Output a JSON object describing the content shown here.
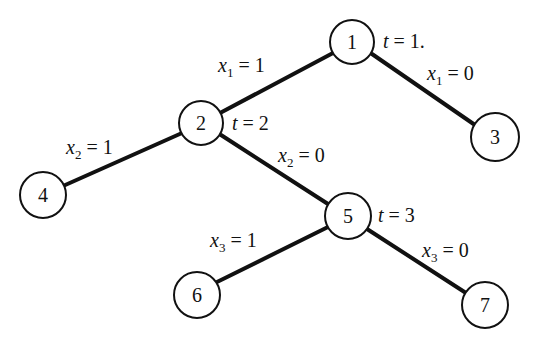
{
  "diagram": {
    "type": "branch-and-bound tree",
    "nodes": [
      {
        "id": "1",
        "label": "1",
        "cx": 352,
        "cy": 42
      },
      {
        "id": "2",
        "label": "2",
        "cx": 201,
        "cy": 123
      },
      {
        "id": "3",
        "label": "3",
        "cx": 495,
        "cy": 137
      },
      {
        "id": "4",
        "label": "4",
        "cx": 43,
        "cy": 195
      },
      {
        "id": "5",
        "label": "5",
        "cx": 348,
        "cy": 216
      },
      {
        "id": "6",
        "label": "6",
        "cx": 197,
        "cy": 295
      },
      {
        "id": "7",
        "label": "7",
        "cx": 485,
        "cy": 305
      }
    ],
    "edges": [
      {
        "from": "1",
        "to": "2",
        "var": "x",
        "sub": "1",
        "eq": " = ",
        "val": "1"
      },
      {
        "from": "1",
        "to": "3",
        "var": "x",
        "sub": "1",
        "eq": " = ",
        "val": "0"
      },
      {
        "from": "2",
        "to": "4",
        "var": "x",
        "sub": "2",
        "eq": " = ",
        "val": "1"
      },
      {
        "from": "2",
        "to": "5",
        "var": "x",
        "sub": "2",
        "eq": " = ",
        "val": "0"
      },
      {
        "from": "5",
        "to": "6",
        "var": "x",
        "sub": "3",
        "eq": " = ",
        "val": "1"
      },
      {
        "from": "5",
        "to": "7",
        "var": "x",
        "sub": "3",
        "eq": " = ",
        "val": "0"
      }
    ],
    "stage_labels": [
      {
        "node": "1",
        "var": "t",
        "eq": " = ",
        "val": "1."
      },
      {
        "node": "2",
        "var": "t",
        "eq": " = ",
        "val": "2"
      },
      {
        "node": "5",
        "var": "t",
        "eq": " = ",
        "val": "3"
      }
    ]
  }
}
